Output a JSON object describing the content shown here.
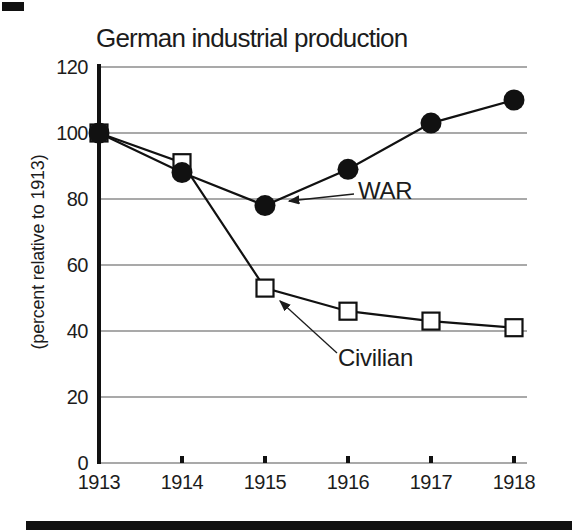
{
  "page_kind": "scanned-chart",
  "chart_data": {
    "type": "line",
    "title": "German industrial production",
    "ylabel": "(percent relative to 1913)",
    "xlabel": "",
    "x": [
      1913,
      1914,
      1915,
      1916,
      1917,
      1918
    ],
    "ylim": [
      0,
      120
    ],
    "yticks": [
      0,
      20,
      40,
      60,
      80,
      100,
      120
    ],
    "grid": true,
    "legend_position": "inline-annotations",
    "series": [
      {
        "name": "WAR",
        "marker": "filled-circle",
        "color": "#111111",
        "values": [
          100,
          88,
          78,
          89,
          103,
          110
        ]
      },
      {
        "name": "Civilian",
        "marker": "open-square",
        "color": "#111111",
        "values": [
          100,
          91,
          53,
          46,
          43,
          41
        ]
      }
    ],
    "annotations": [
      {
        "label": "WAR",
        "points_to_series": "WAR",
        "points_to_x": 1915
      },
      {
        "label": "Civilian",
        "points_to_series": "Civilian",
        "points_to_x": 1915
      }
    ],
    "colors": {
      "line": "#111111",
      "text": "#1c1c1c",
      "gridline": "#8d8d8d",
      "background": "#ffffff"
    }
  }
}
